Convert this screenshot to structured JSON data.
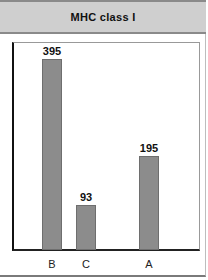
{
  "chart_data": {
    "type": "bar",
    "title": "MHC class I",
    "categories": [
      "B",
      "C",
      "A"
    ],
    "values": [
      395,
      93,
      195
    ],
    "xlabel": "",
    "ylabel": "",
    "ylim": [
      0,
      450
    ],
    "grid": false,
    "legend": null,
    "bar_color": "#8c8c8c"
  }
}
